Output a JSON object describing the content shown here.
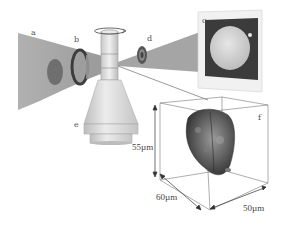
{
  "figure": {
    "labels": {
      "a": "a",
      "b": "b",
      "c": "c",
      "d": "d",
      "e": "e",
      "f": "f"
    },
    "dimensions": {
      "height": "55µm",
      "depth": "60µm",
      "width": "50µm"
    },
    "components": [
      {
        "id": "a",
        "name": "incoming-light-beam"
      },
      {
        "id": "b",
        "name": "lens-ring"
      },
      {
        "id": "c",
        "name": "rotating-capillary-sample-holder"
      },
      {
        "id": "d",
        "name": "second-lens-ring"
      },
      {
        "id": "e",
        "name": "projection-screen-image"
      },
      {
        "id": "f",
        "name": "3d-reconstruction-box"
      }
    ],
    "colors": {
      "beam": "#9a9a9a",
      "beam_dark": "#6e6e6e",
      "objective": "#d6d6d6",
      "screen_frame": "#eeeeee",
      "screen_bg": "#3a3a3a",
      "cell": "#555555"
    }
  }
}
